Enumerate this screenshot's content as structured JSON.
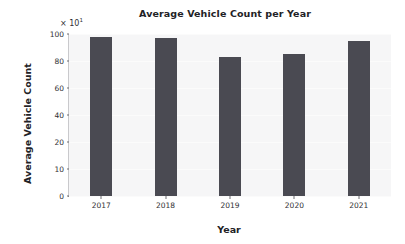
{
  "chart_data": {
    "type": "bar",
    "title": "Average Vehicle Count per Year",
    "xlabel": "Year",
    "ylabel": "Average Vehicle Count",
    "y_offset_label": "× 10",
    "y_offset_exponent": "1",
    "categories": [
      "2017",
      "2018",
      "2019",
      "2020",
      "2021"
    ],
    "values": [
      98,
      97,
      83,
      85,
      95
    ],
    "yticks": [
      0,
      10,
      20,
      40,
      60,
      80,
      100
    ],
    "ytick_labels": [
      "0",
      "10",
      "20",
      "40",
      "60",
      "80",
      "100"
    ],
    "ylim": [
      0,
      105
    ],
    "grid": false,
    "legend": "none",
    "bar_color": "#4a4a52",
    "plot_background": "#f6f6f7",
    "text_color": "#303034",
    "axis_color": "#6e6e73"
  }
}
